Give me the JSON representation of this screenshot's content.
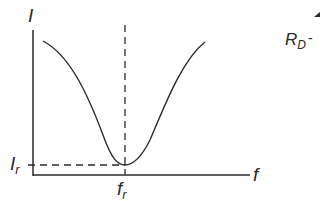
{
  "diagram": {
    "y_axis_label": "I",
    "x_axis_label": "f",
    "min_current_label": "I",
    "min_current_sub": "r",
    "resonant_freq_label": "f",
    "resonant_freq_sub": "r",
    "cutoff_label": "R",
    "cutoff_sub": "D",
    "cutoff_dash": "-",
    "colors": {
      "line": "#2a2a2a",
      "background": "#ffffff"
    }
  }
}
